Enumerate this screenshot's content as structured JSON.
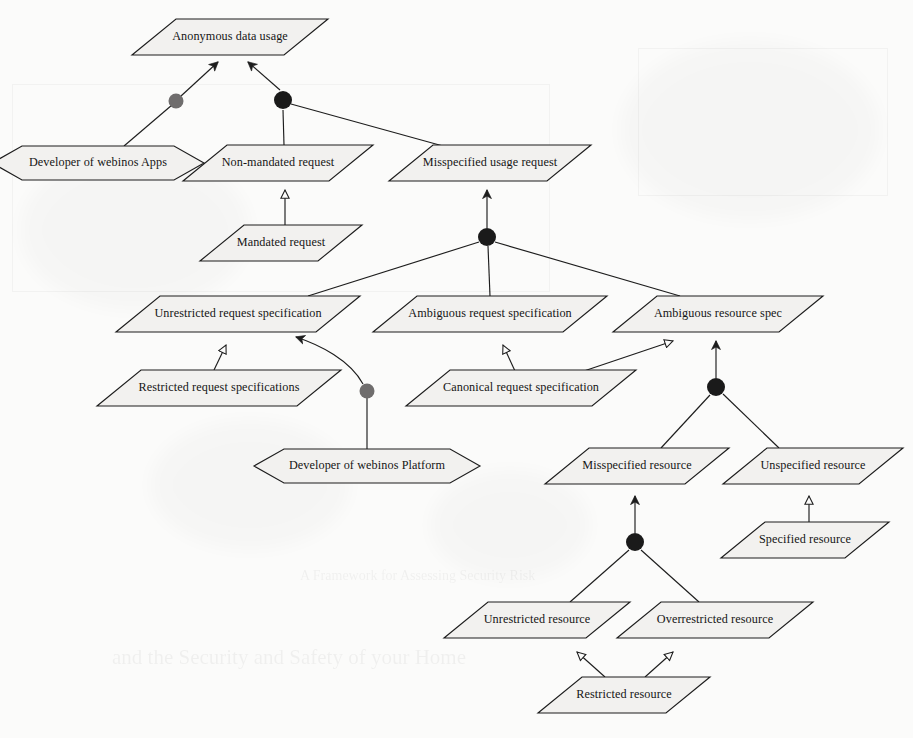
{
  "diagram": {
    "title": "Anonymous data usage",
    "type": "goal-model",
    "notation": "i* / KAOS-style obstacle and goal refinement diagram",
    "background_color": "#fbfbfa",
    "node_fill_color": "#f2f1ef",
    "line_color": "#1d1d1d",
    "dot_dark_color": "#1a1a1a",
    "dot_gray_color": "#6f6d6d",
    "nodes": [
      {
        "id": "anon",
        "label": "Anonymous data usage",
        "shape": "parallelogram",
        "cx": 230,
        "cy": 37,
        "w": 152,
        "h": 36,
        "skew": 22
      },
      {
        "id": "devapps",
        "label": "Developer of webinos Apps",
        "shape": "hexagon",
        "cx": 98,
        "cy": 163,
        "w": 168,
        "h": 34,
        "skew": 22
      },
      {
        "id": "nonmand",
        "label": "Non-mandated request",
        "shape": "parallelogram",
        "cx": 278,
        "cy": 163,
        "w": 146,
        "h": 36,
        "skew": 22
      },
      {
        "id": "misusage",
        "label": "Misspecified usage request",
        "shape": "parallelogram",
        "cx": 490,
        "cy": 163,
        "w": 158,
        "h": 36,
        "skew": 22
      },
      {
        "id": "mandated",
        "label": "Mandated request",
        "shape": "parallelogram",
        "cx": 281,
        "cy": 243,
        "w": 118,
        "h": 36,
        "skew": 22
      },
      {
        "id": "unresreq",
        "label": "Unrestricted request specification",
        "shape": "parallelogram",
        "cx": 238,
        "cy": 314,
        "w": 200,
        "h": 36,
        "skew": 22
      },
      {
        "id": "ambreq",
        "label": "Ambiguous request specification",
        "shape": "parallelogram",
        "cx": 490,
        "cy": 314,
        "w": 190,
        "h": 36,
        "skew": 22
      },
      {
        "id": "ambres",
        "label": "Ambiguous resource spec",
        "shape": "parallelogram",
        "cx": 718,
        "cy": 314,
        "w": 166,
        "h": 36,
        "skew": 22
      },
      {
        "id": "resreq",
        "label": "Restricted request specifications",
        "shape": "parallelogram",
        "cx": 219,
        "cy": 388,
        "w": 200,
        "h": 36,
        "skew": 22
      },
      {
        "id": "canonreq",
        "label": "Canonical request specification",
        "shape": "parallelogram",
        "cx": 521,
        "cy": 388,
        "w": 186,
        "h": 36,
        "skew": 22
      },
      {
        "id": "devplat",
        "label": "Developer of webinos Platform",
        "shape": "hexagon",
        "cx": 367,
        "cy": 466,
        "w": 182,
        "h": 34,
        "skew": 22
      },
      {
        "id": "misres",
        "label": "Misspecified resource",
        "shape": "parallelogram",
        "cx": 637,
        "cy": 466,
        "w": 140,
        "h": 36,
        "skew": 22
      },
      {
        "id": "unspecres",
        "label": "Unspecified resource",
        "shape": "parallelogram",
        "cx": 813,
        "cy": 466,
        "w": 136,
        "h": 36,
        "skew": 22
      },
      {
        "id": "specres",
        "label": "Specified resource",
        "shape": "parallelogram",
        "cx": 805,
        "cy": 540,
        "w": 124,
        "h": 36,
        "skew": 22
      },
      {
        "id": "unresres",
        "label": "Unrestricted resource",
        "shape": "parallelogram",
        "cx": 537,
        "cy": 620,
        "w": 142,
        "h": 36,
        "skew": 22
      },
      {
        "id": "overres",
        "label": "Overrestricted resource",
        "shape": "parallelogram",
        "cx": 715,
        "cy": 620,
        "w": 152,
        "h": 36,
        "skew": 22
      },
      {
        "id": "restres",
        "label": "Restricted resource",
        "shape": "parallelogram",
        "cx": 624,
        "cy": 695,
        "w": 128,
        "h": 36,
        "skew": 22
      }
    ],
    "junctions": [
      {
        "id": "j-devapps",
        "x": 176,
        "y": 101,
        "r": 7.5,
        "color": "#6f6d6d",
        "kind": "gray"
      },
      {
        "id": "j-anon",
        "x": 283,
        "y": 100,
        "r": 9.0,
        "color": "#1a1a1a",
        "kind": "dark"
      },
      {
        "id": "j-misreq",
        "x": 487,
        "y": 237,
        "r": 9.0,
        "color": "#1a1a1a",
        "kind": "dark"
      },
      {
        "id": "j-devplat",
        "x": 367,
        "y": 391,
        "r": 7.5,
        "color": "#6f6d6d",
        "kind": "gray"
      },
      {
        "id": "j-ambres",
        "x": 716,
        "y": 387,
        "r": 9.0,
        "color": "#1a1a1a",
        "kind": "dark"
      },
      {
        "id": "j-misres",
        "x": 635,
        "y": 542,
        "r": 9.0,
        "color": "#1a1a1a",
        "kind": "dark"
      }
    ],
    "edges": [
      {
        "from": "devapps",
        "to": "j-devapps",
        "arrow": "none",
        "label": ""
      },
      {
        "from": "j-devapps",
        "to": "anon",
        "arrow": "solid",
        "label": ""
      },
      {
        "from": "nonmand",
        "to": "j-anon",
        "arrow": "none",
        "label": ""
      },
      {
        "from": "misusage",
        "to": "j-anon",
        "arrow": "none",
        "label": ""
      },
      {
        "from": "j-anon",
        "to": "anon",
        "arrow": "solid",
        "label": ""
      },
      {
        "from": "mandated",
        "to": "nonmand",
        "arrow": "hollow",
        "label": ""
      },
      {
        "from": "j-misreq",
        "to": "misusage",
        "arrow": "solid",
        "label": ""
      },
      {
        "from": "unresreq",
        "to": "j-misreq",
        "arrow": "none",
        "label": ""
      },
      {
        "from": "ambreq",
        "to": "j-misreq",
        "arrow": "none",
        "label": ""
      },
      {
        "from": "ambres",
        "to": "j-misreq",
        "arrow": "none",
        "label": ""
      },
      {
        "from": "resreq",
        "to": "unresreq",
        "arrow": "hollow",
        "label": ""
      },
      {
        "from": "devplat",
        "to": "j-devplat",
        "arrow": "none",
        "label": ""
      },
      {
        "from": "j-devplat",
        "to": "unresreq",
        "arrow": "solid",
        "label": ""
      },
      {
        "from": "canonreq",
        "to": "ambreq",
        "arrow": "hollow",
        "label": ""
      },
      {
        "from": "canonreq",
        "to": "ambres",
        "arrow": "hollow",
        "label": ""
      },
      {
        "from": "j-ambres",
        "to": "ambres",
        "arrow": "solid",
        "label": ""
      },
      {
        "from": "misres",
        "to": "j-ambres",
        "arrow": "none",
        "label": ""
      },
      {
        "from": "unspecres",
        "to": "j-ambres",
        "arrow": "none",
        "label": ""
      },
      {
        "from": "specres",
        "to": "unspecres",
        "arrow": "hollow",
        "label": ""
      },
      {
        "from": "j-misres",
        "to": "misres",
        "arrow": "solid",
        "label": ""
      },
      {
        "from": "unresres",
        "to": "j-misres",
        "arrow": "none",
        "label": ""
      },
      {
        "from": "overres",
        "to": "j-misres",
        "arrow": "none",
        "label": ""
      },
      {
        "from": "restres",
        "to": "unresres",
        "arrow": "hollow",
        "label": ""
      },
      {
        "from": "restres",
        "to": "overres",
        "arrow": "hollow",
        "label": ""
      }
    ],
    "scan_ghost_text": [
      {
        "text": "and the Security and Safety of your Home",
        "x": 112,
        "y": 655,
        "size": 21
      },
      {
        "text": "A Framework for Assessing Security Risk",
        "x": 300,
        "y": 575,
        "size": 14
      }
    ]
  }
}
